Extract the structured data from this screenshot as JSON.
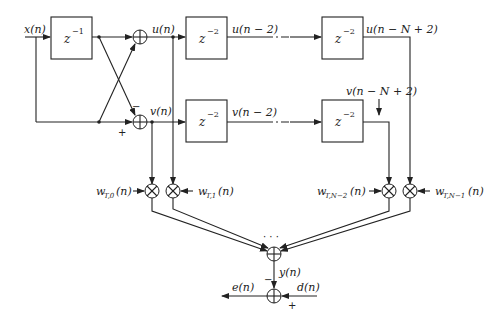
{
  "diagram": {
    "type": "block-diagram",
    "title": "",
    "signals": {
      "input": "x(n)",
      "u": "u(n)",
      "v": "v(n)",
      "u_delayed": "u(n − 2)",
      "v_delayed": "v(n − 2)",
      "u_last": "u(n − N + 2)",
      "v_last": "v(n − N + 2)",
      "output": "y(n)",
      "error": "e(n)",
      "desired": "d(n)"
    },
    "blocks": {
      "delay1": {
        "base": "z",
        "exp": "−1"
      },
      "delay_u1": {
        "base": "z",
        "exp": "−2"
      },
      "delay_v1": {
        "base": "z",
        "exp": "−2"
      },
      "delay_uN": {
        "base": "z",
        "exp": "−2"
      },
      "delay_vN": {
        "base": "z",
        "exp": "−2"
      }
    },
    "weights": {
      "w0": {
        "base": "w",
        "sub": "T,0",
        "arg": "(n)"
      },
      "w1": {
        "base": "w",
        "sub": "T,1",
        "arg": "(n)"
      },
      "wN2": {
        "base": "w",
        "sub": "T,N−2",
        "arg": "(n)"
      },
      "wN1": {
        "base": "w",
        "sub": "T,N−1",
        "arg": "(n)"
      }
    },
    "signs": {
      "v_adder_minus": "−",
      "v_adder_plus": "+",
      "out_minus": "−",
      "out_plus": "+"
    },
    "ellipsis": "· · ·"
  }
}
